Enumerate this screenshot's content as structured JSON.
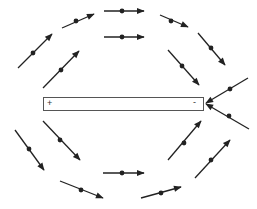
{
  "diagram": {
    "type": "field-lines-around-bar",
    "line_color": "#222222",
    "bar": {
      "x": 43,
      "y": 97,
      "width": 160,
      "height": 13,
      "left_label": "+",
      "right_label": "-"
    },
    "arrows": [
      {
        "id": "upper-left-outer",
        "x1": 18,
        "y1": 68,
        "x2": 52,
        "y2": 34,
        "dot": [
          33,
          53
        ]
      },
      {
        "id": "upper-left-inner",
        "x1": 43,
        "y1": 88,
        "x2": 79,
        "y2": 51,
        "dot": [
          61,
          70
        ]
      },
      {
        "id": "top-left",
        "x1": 62,
        "y1": 28,
        "x2": 94,
        "y2": 14,
        "dot": [
          76,
          21
        ]
      },
      {
        "id": "top-center-outer",
        "x1": 104,
        "y1": 11,
        "x2": 144,
        "y2": 11,
        "dot": [
          122,
          11
        ]
      },
      {
        "id": "top-center-inner",
        "x1": 104,
        "y1": 37,
        "x2": 144,
        "y2": 37,
        "dot": [
          122,
          37
        ]
      },
      {
        "id": "top-right",
        "x1": 160,
        "y1": 15,
        "x2": 188,
        "y2": 27,
        "dot": [
          171,
          21
        ]
      },
      {
        "id": "upper-right-outer",
        "x1": 198,
        "y1": 33,
        "x2": 225,
        "y2": 65,
        "dot": [
          211,
          48
        ]
      },
      {
        "id": "upper-right-inner",
        "x1": 168,
        "y1": 50,
        "x2": 199,
        "y2": 85,
        "dot": [
          182,
          66
        ]
      },
      {
        "id": "cross-upper",
        "x1": 248,
        "y1": 78,
        "x2": 206,
        "y2": 103,
        "dot": [
          230,
          89
        ]
      },
      {
        "id": "cross-lower",
        "x1": 249,
        "y1": 129,
        "x2": 206,
        "y2": 104,
        "dot": [
          229,
          116
        ],
        "reverse": true
      },
      {
        "id": "lower-left-outer",
        "x1": 15,
        "y1": 130,
        "x2": 44,
        "y2": 170,
        "dot": [
          29,
          149
        ]
      },
      {
        "id": "lower-left-inner",
        "x1": 43,
        "y1": 121,
        "x2": 80,
        "y2": 160,
        "dot": [
          60,
          140
        ]
      },
      {
        "id": "bottom-left",
        "x1": 60,
        "y1": 181,
        "x2": 103,
        "y2": 198,
        "dot": [
          81,
          190
        ]
      },
      {
        "id": "bottom-center",
        "x1": 103,
        "y1": 173,
        "x2": 144,
        "y2": 173,
        "dot": [
          122,
          173
        ]
      },
      {
        "id": "bottom-right",
        "x1": 141,
        "y1": 198,
        "x2": 181,
        "y2": 187,
        "dot": [
          161,
          193
        ]
      },
      {
        "id": "lower-right-inner",
        "x1": 168,
        "y1": 160,
        "x2": 201,
        "y2": 121,
        "dot": [
          184,
          143
        ]
      },
      {
        "id": "lower-right-outer",
        "x1": 195,
        "y1": 178,
        "x2": 230,
        "y2": 140,
        "dot": [
          211,
          160
        ]
      }
    ]
  }
}
